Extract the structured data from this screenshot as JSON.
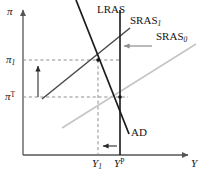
{
  "figure": {
    "kind": "economics-ad-as-diagram",
    "title": "",
    "background_color": "#ffffff"
  },
  "axes": {
    "y_axis_label": "π",
    "x_axis_label": "Y",
    "y_axis_name": "inflation",
    "x_axis_name": "output",
    "origin": {
      "x": 23,
      "y": 155
    },
    "x_axis_end": {
      "x": 190,
      "y": 155
    },
    "y_axis_top": {
      "x": 23,
      "y": 8
    },
    "axis_color": "#555555"
  },
  "tick_labels": {
    "y_ticks": [
      {
        "id": "pi_1",
        "base": "π",
        "sub": "1",
        "sup": "",
        "y": 60
      },
      {
        "id": "pi_T",
        "base": "π",
        "sub": "",
        "sup": "T",
        "y": 97
      }
    ],
    "x_ticks": [
      {
        "id": "Y_1",
        "base": "Y",
        "sub": "1",
        "sup": "",
        "x": 98
      },
      {
        "id": "Y_P",
        "base": "Y",
        "sub": "",
        "sup": "P",
        "x": 120
      }
    ]
  },
  "curves": [
    {
      "id": "LRAS",
      "label": "LRAS",
      "color": "#1a1a1a",
      "width": 1.6,
      "style": "solid",
      "x1": 120,
      "y1": 10,
      "x2": 120,
      "y2": 155,
      "label_x": 98,
      "label_y": 6
    },
    {
      "id": "AD",
      "label": "AD",
      "color": "#1a1a1a",
      "width": 1.6,
      "style": "solid",
      "x1": 76,
      "y1": 0,
      "x2": 129,
      "y2": 134,
      "label_x": 131,
      "label_y": 130
    },
    {
      "id": "SRAS_1",
      "label": "SRAS",
      "label_sub": "1",
      "color": "#4a4a4a",
      "width": 1.5,
      "style": "solid",
      "x1": 42,
      "y1": 99,
      "x2": 130,
      "y2": 28,
      "label_x": 131,
      "label_y": 17
    },
    {
      "id": "SRAS_0",
      "label": "SRAS",
      "label_sub": "0",
      "color": "#c4c4c4",
      "width": 1.5,
      "style": "solid",
      "x1": 62,
      "y1": 128,
      "x2": 196,
      "y2": 44,
      "label_x": 158,
      "label_y": 33
    }
  ],
  "equilibria": [
    {
      "id": "eq-short-run",
      "x": 98,
      "y": 60,
      "note": "AD x SRAS_1 at (Y_1, pi_1)"
    },
    {
      "id": "eq-long-run",
      "x": 120,
      "y": 97,
      "note": "AD x SRAS_0 x LRAS at (Y_P, pi_T)"
    }
  ],
  "guide_lines": [
    {
      "id": "guide-pi-1",
      "orientation": "horizontal",
      "x1": 23,
      "y1": 60,
      "x2": 120,
      "y2": 60
    },
    {
      "id": "guide-pi-T",
      "orientation": "horizontal",
      "x1": 23,
      "y1": 97,
      "x2": 128,
      "y2": 97
    },
    {
      "id": "guide-Y-1",
      "orientation": "vertical",
      "x1": 98,
      "y1": 60,
      "x2": 98,
      "y2": 155
    }
  ],
  "annotation_arrows": [
    {
      "id": "inflation-rise-arrow",
      "direction": "up",
      "color": "#2a2a2a",
      "x1": 38,
      "y1": 97,
      "x2": 38,
      "y2": 64,
      "meaning": "inflation rises from pi_T to pi_1"
    },
    {
      "id": "output-fall-arrow",
      "direction": "left",
      "color": "#2a2a2a",
      "x1": 117,
      "y1": 146,
      "x2": 101,
      "y2": 146,
      "meaning": "output falls from Y_P to Y_1"
    },
    {
      "id": "sras-shift-arrow",
      "direction": "left",
      "color": "#8c8c8c",
      "x1": 152,
      "y1": 46,
      "x2": 122,
      "y2": 46,
      "meaning": "SRAS shifts left from SRAS_0 to SRAS_1"
    }
  ],
  "colors": {
    "ink": "#1a1a1a",
    "axis": "#555555",
    "sras1": "#4a4a4a",
    "sras0": "#c4c4c4",
    "dashed": "#8f8f8f",
    "arrow_gray": "#8c8c8c"
  }
}
